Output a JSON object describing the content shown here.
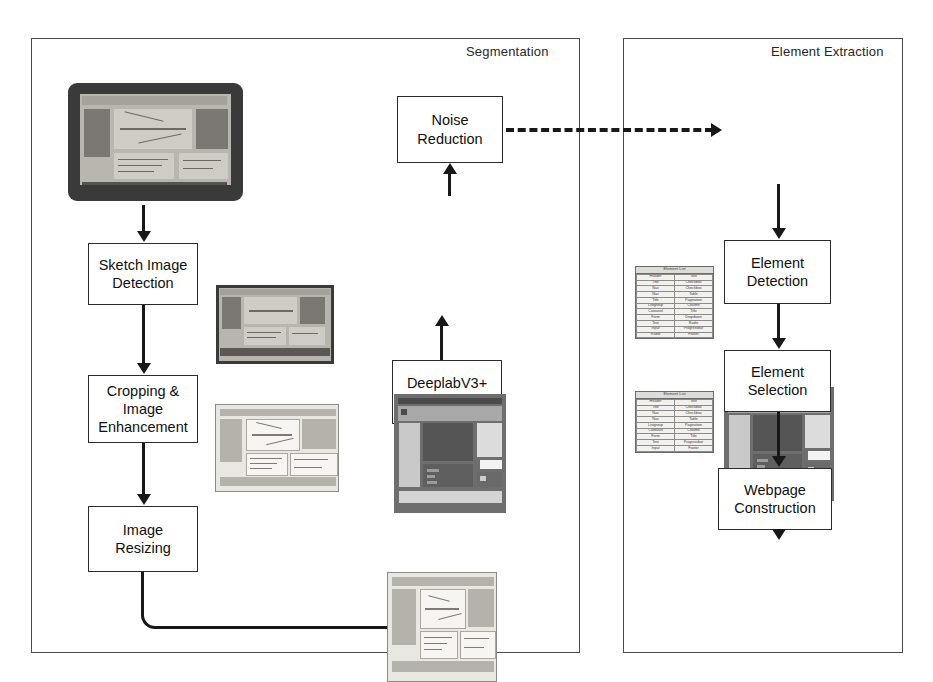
{
  "diagram": {
    "title_visible": false,
    "panels": [
      {
        "id": "segmentation",
        "label": "Segmentation"
      },
      {
        "id": "element-extraction",
        "label": "Element Extraction"
      }
    ],
    "process_boxes": [
      {
        "id": "sketch-image-detection",
        "line1": "Sketch Image",
        "line2": "Detection",
        "line3": ""
      },
      {
        "id": "cropping-image-enhancement",
        "line1": "Cropping &",
        "line2": "Image",
        "line3": "Enhancement"
      },
      {
        "id": "image-resizing",
        "line1": "Image",
        "line2": "Resizing",
        "line3": ""
      },
      {
        "id": "deeplabv3-model",
        "line1": "DeeplabV3+",
        "line2": "Model",
        "line3": ""
      },
      {
        "id": "noise-reduction",
        "line1": "Noise",
        "line2": "Reduction",
        "line3": ""
      },
      {
        "id": "element-detection",
        "line1": "Element",
        "line2": "Detection",
        "line3": ""
      },
      {
        "id": "element-selection",
        "line1": "Element",
        "line2": "Selection",
        "line3": ""
      },
      {
        "id": "webpage-construction",
        "line1": "Webpage",
        "line2": "Construction",
        "line3": ""
      }
    ],
    "artifacts": [
      {
        "id": "photo-monitor-sketch",
        "caption": "photograph of monitor displaying hand-drawn webpage sketch"
      },
      {
        "id": "cropped-sketch-photo",
        "caption": "cropped photograph of the sketch"
      },
      {
        "id": "enhanced-sketch-scan",
        "caption": "contrast enhanced / resized sketch image"
      },
      {
        "id": "resized-sketch-input",
        "caption": "resized sketch image fed to the model"
      },
      {
        "id": "segmentation-mask",
        "caption": "segmentation mask output"
      },
      {
        "id": "denoised-mask",
        "caption": "noise reduced segmentation mask"
      },
      {
        "id": "constructed-webpage",
        "caption": "generated webpage preview"
      }
    ],
    "element_tables": [
      {
        "id": "element-list-detected",
        "header": "Element List",
        "columns": [
          "left",
          "right"
        ],
        "rows": [
          [
            "Header",
            "Text"
          ],
          [
            "Title",
            "Checkbox"
          ],
          [
            "Nav",
            "Checkbox"
          ],
          [
            "Nav",
            "Table"
          ],
          [
            "Title",
            "Pagination"
          ],
          [
            "Listgroup",
            "Column"
          ],
          [
            "Carousel",
            "Title"
          ],
          [
            "Form",
            "Dropdown"
          ],
          [
            "Text",
            "Radio"
          ],
          [
            "Input",
            "Progressbar"
          ],
          [
            "Radio",
            "Footer"
          ]
        ]
      },
      {
        "id": "element-list-selected",
        "header": "Element List",
        "columns": [
          "left",
          "right"
        ],
        "rows": [
          [
            "Header",
            "Text"
          ],
          [
            "Title",
            "Checkbox"
          ],
          [
            "Nav",
            "Checkbox"
          ],
          [
            "Nav",
            "Table"
          ],
          [
            "Listgroup",
            "Pagination"
          ],
          [
            "Carousel",
            "Column"
          ],
          [
            "Form",
            "Title"
          ],
          [
            "Text",
            "Progressbar"
          ],
          [
            "Input",
            "Footer"
          ]
        ]
      }
    ],
    "connectors": [
      {
        "id": "monitor-to-sketch-detection",
        "style": "solid-arrow",
        "direction": "down"
      },
      {
        "id": "sketch-detection-to-cropping",
        "style": "solid-arrow",
        "direction": "down"
      },
      {
        "id": "cropping-to-resizing",
        "style": "solid-arrow",
        "direction": "down"
      },
      {
        "id": "resizing-to-resized-image",
        "style": "solid-elbow-arrow",
        "direction": "right-up"
      },
      {
        "id": "resized-image-to-deeplab",
        "style": "solid-arrow",
        "direction": "up"
      },
      {
        "id": "deeplab-to-mask",
        "style": "solid-arrow",
        "direction": "up"
      },
      {
        "id": "mask-to-noise-reduction",
        "style": "solid-arrow",
        "direction": "up"
      },
      {
        "id": "noise-reduction-to-element-extraction",
        "style": "dashed-arrow",
        "direction": "right"
      },
      {
        "id": "denoised-mask-to-element-detection",
        "style": "solid-arrow",
        "direction": "down"
      },
      {
        "id": "element-detection-to-selection",
        "style": "solid-arrow",
        "direction": "down"
      },
      {
        "id": "element-selection-to-webpage-construction",
        "style": "solid-arrow",
        "direction": "down"
      },
      {
        "id": "webpage-construction-to-preview",
        "style": "solid-arrow",
        "direction": "down"
      }
    ],
    "colors": {
      "stroke": "#181818",
      "panel_border": "#4a4a4a",
      "box_fill": "#ffffff",
      "text": "#101010"
    }
  }
}
